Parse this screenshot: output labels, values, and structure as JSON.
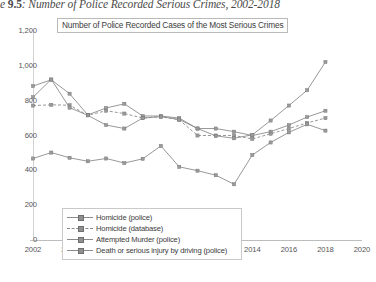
{
  "figure": {
    "caption_prefix": "e ",
    "caption_number": "9.5",
    "caption_rest": ": Number of Police Recorded Serious Crimes, 2002-2018"
  },
  "chart_data": {
    "type": "line",
    "title": "Number of Police Recorded Cases of the Most Serious Crimes",
    "xlabel": "",
    "ylabel": "",
    "xlim": [
      2002,
      2020
    ],
    "ylim": [
      0,
      1200
    ],
    "xticks": [
      "2002",
      "2004",
      "2006",
      "2008",
      "2010",
      "2012",
      "2014",
      "2016",
      "2018",
      "2020"
    ],
    "yticks": [
      "0",
      "200",
      "400",
      "600",
      "800",
      "1,000",
      "1,200"
    ],
    "grid": false,
    "legend_position": "inside-bottom-left",
    "x": [
      2002,
      2003,
      2004,
      2005,
      2006,
      2007,
      2008,
      2009,
      2010,
      2011,
      2012,
      2013,
      2014,
      2015,
      2016,
      2017,
      2018
    ],
    "series": [
      {
        "name": "Homicide (police)",
        "style": "solid",
        "marker": "square",
        "values": [
          884,
          920,
          840,
          718,
          758,
          782,
          712,
          712,
          700,
          640,
          640,
          622,
          600,
          622,
          660,
          706,
          742
        ]
      },
      {
        "name": "Homicide (database)",
        "style": "dashed",
        "marker": "square",
        "values": [
          772,
          776,
          774,
          716,
          742,
          726,
          700,
          708,
          690,
          600,
          600,
          600,
          580,
          610,
          640,
          672,
          700
        ]
      },
      {
        "name": "Attempted Murder (police)",
        "style": "solid",
        "marker": "square",
        "values": [
          820,
          922,
          760,
          716,
          660,
          640,
          700,
          708,
          692,
          640,
          598,
          584,
          604,
          686,
          772,
          860,
          1022
        ]
      },
      {
        "name": "Death or serious injury by driving (police)",
        "style": "solid",
        "marker": "square",
        "values": [
          468,
          502,
          472,
          452,
          468,
          442,
          466,
          540,
          420,
          398,
          372,
          320,
          488,
          560,
          618,
          664,
          628
        ]
      }
    ]
  },
  "legend": {
    "items": [
      "Homicide (police)",
      "Homicide (database)",
      "Attempted Murder (police)",
      "Death or serious injury by driving (police)"
    ]
  }
}
